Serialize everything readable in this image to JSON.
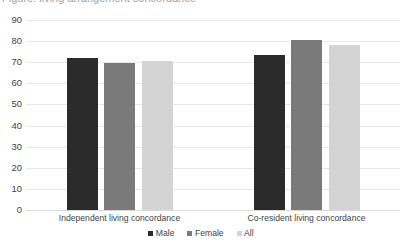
{
  "chart_data": {
    "type": "bar",
    "title": "",
    "xlabel": "",
    "ylabel": "",
    "ylim": [
      0,
      90
    ],
    "ytick_step": 10,
    "yticks": [
      90,
      80,
      70,
      60,
      50,
      40,
      30,
      20,
      10,
      0
    ],
    "grid": true,
    "legend_position": "bottom",
    "categories": [
      "Independent living concordance",
      "Co-resident living concordance"
    ],
    "series": [
      {
        "name": "Male",
        "values": [
          72,
          73.5
        ],
        "color": "#2b2b2b"
      },
      {
        "name": "Female",
        "values": [
          69.5,
          80.5
        ],
        "color": "#7a7a7a"
      },
      {
        "name": "All",
        "values": [
          70.5,
          78
        ],
        "color": "#d4d4d4"
      }
    ]
  },
  "clipped_title": "Figure: living arrangement concordance",
  "legend": {
    "items": [
      {
        "label": "Male",
        "color": "#2b2b2b"
      },
      {
        "label": "Female",
        "color": "#7a7a7a"
      },
      {
        "label": "All",
        "color": "#d4d4d4"
      }
    ]
  }
}
